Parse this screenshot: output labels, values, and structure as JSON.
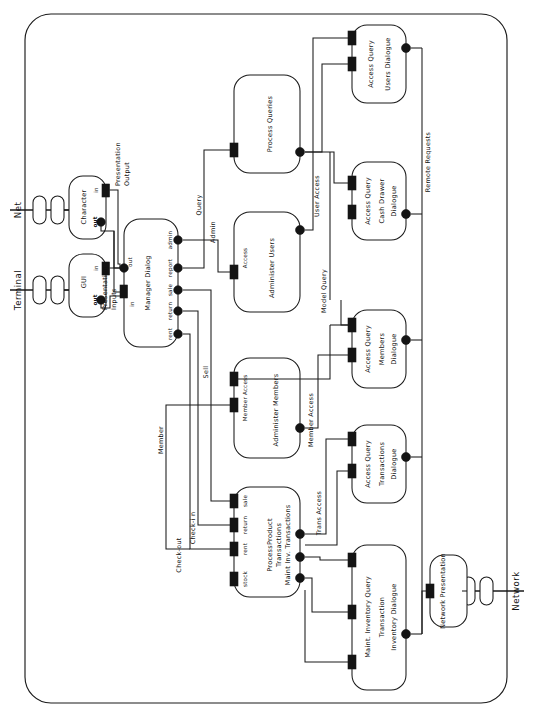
{
  "diagram": {
    "orientation": "rotated-90",
    "external_ports": [
      {
        "name": "net-external-port",
        "label": "Net"
      },
      {
        "name": "terminal-external-port",
        "label": "Terminal"
      },
      {
        "name": "network-external-port",
        "label": "Network"
      }
    ],
    "presentation_boxes": [
      {
        "name": "character-presentation-box",
        "title": "Character",
        "ports": [
          "out",
          "in"
        ]
      },
      {
        "name": "gui-presentation-box",
        "title": "GUI",
        "ports": [
          "out",
          "in"
        ]
      },
      {
        "name": "network-presentation-box",
        "title": "Network Presentation",
        "ports": []
      }
    ],
    "manager_dialog": {
      "name": "manager-dialog-box",
      "title": "Manager Dialog",
      "left_ports": [
        "out",
        "in"
      ],
      "right_ports": [
        "rent",
        "return",
        "sale",
        "report",
        "admin"
      ]
    },
    "model_boxes": [
      {
        "name": "process-queries-box",
        "title": "Process Queries",
        "ports": []
      },
      {
        "name": "administer-users-box",
        "title": "Administer Users",
        "ports": [
          "Access"
        ]
      },
      {
        "name": "administer-members-box",
        "title": "Administer Members",
        "ports": [
          "Member Access"
        ]
      },
      {
        "name": "product-transactions-box",
        "title_line1": "ProcessProduct",
        "title_line2": "Transactions",
        "title_line3": "Maint Inv. Transactions",
        "ports": [
          "stock",
          "rent",
          "return",
          "sale"
        ]
      }
    ],
    "dialogue_boxes": [
      {
        "name": "users-dialogue-box",
        "title_line1": "Access Query",
        "title_line2": "Users Dialogue"
      },
      {
        "name": "cash-drawer-dialogue-box",
        "title_line1": "Access Query",
        "title_line2": "Cash Drawer",
        "title_line3": "Dialogue"
      },
      {
        "name": "members-dialogue-box",
        "title_line1": "Access Query",
        "title_line2": "Members",
        "title_line3": "Dialogue"
      },
      {
        "name": "transactions-dialogue-box",
        "title_line1": "Access Query",
        "title_line2": "Transactions",
        "title_line3": "Dialogue"
      },
      {
        "name": "inventory-dialogue-box",
        "title_line1": "Maint. Inventory Query",
        "title_line2": "Transaction",
        "title_line3": "Inventory Dialogue"
      }
    ],
    "connector_labels": [
      {
        "name": "conn-presentation-output",
        "line1": "Presentation",
        "line2": "Output"
      },
      {
        "name": "conn-presentation-inputs",
        "line1": "Presentation",
        "line2": "Inputs"
      },
      {
        "name": "conn-query",
        "label": "Query"
      },
      {
        "name": "conn-admin",
        "label": "Admin"
      },
      {
        "name": "conn-sell",
        "label": "Sell"
      },
      {
        "name": "conn-member",
        "label": "Member"
      },
      {
        "name": "conn-check-in",
        "label": "Check-i n"
      },
      {
        "name": "conn-check-out",
        "label": "Check-out"
      },
      {
        "name": "conn-user-access",
        "label": "User Access"
      },
      {
        "name": "conn-member-access",
        "label": "Member Access"
      },
      {
        "name": "conn-trans-access",
        "label": "Trans Access"
      },
      {
        "name": "conn-model-query",
        "label": "Model Query"
      },
      {
        "name": "conn-remote-requests",
        "label": "Remote Requests"
      }
    ],
    "colors": {
      "stroke": "#1a1a1a",
      "fill": "#ffffff",
      "port": "#141414",
      "text": "#111111"
    }
  }
}
